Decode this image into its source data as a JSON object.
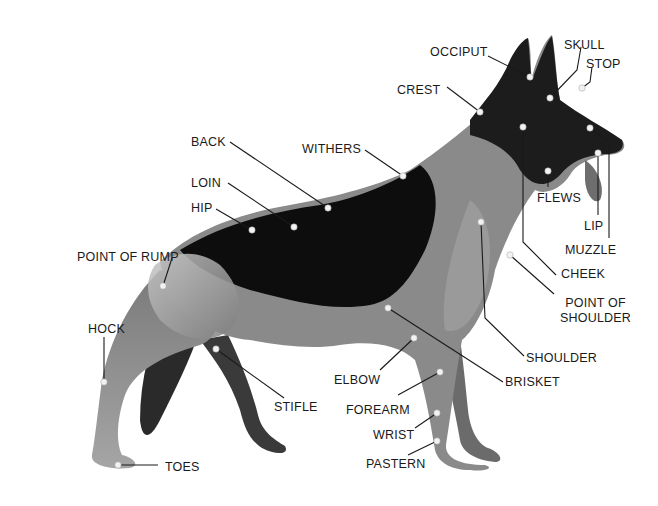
{
  "diagram": {
    "colors": {
      "background": "#ffffff",
      "saddle": "#0d0d0d",
      "tan_coat": "#8a8a8a",
      "light_coat": "#b5b5b5",
      "leader_line": "#1a1a1a",
      "point_marker": "#f2f2f2",
      "label_text": "#1a1a1a"
    },
    "labels": [
      {
        "id": "occiput",
        "text": "OCCIPUT",
        "x": 430,
        "y": 45
      },
      {
        "id": "skull",
        "text": "SKULL",
        "x": 564,
        "y": 38
      },
      {
        "id": "stop",
        "text": "STOP",
        "x": 586,
        "y": 57
      },
      {
        "id": "crest",
        "text": "CREST",
        "x": 397,
        "y": 83
      },
      {
        "id": "back",
        "text": "BACK",
        "x": 191,
        "y": 135
      },
      {
        "id": "withers",
        "text": "WITHERS",
        "x": 302,
        "y": 142
      },
      {
        "id": "loin",
        "text": "LOIN",
        "x": 191,
        "y": 176
      },
      {
        "id": "hip",
        "text": "HIP",
        "x": 191,
        "y": 201
      },
      {
        "id": "flews",
        "text": "FLEWS",
        "x": 537,
        "y": 191
      },
      {
        "id": "lip",
        "text": "LIP",
        "x": 584,
        "y": 219
      },
      {
        "id": "muzzle",
        "text": "MUZZLE",
        "x": 565,
        "y": 243
      },
      {
        "id": "point_of_rump",
        "text": "POINT OF RUMP",
        "x": 77,
        "y": 250
      },
      {
        "id": "cheek",
        "text": "CHEEK",
        "x": 561,
        "y": 267
      },
      {
        "id": "point_of_shoulder",
        "text": "POINT OF\nSHOULDER",
        "x": 560,
        "y": 296
      },
      {
        "id": "hock",
        "text": "HOCK",
        "x": 88,
        "y": 322
      },
      {
        "id": "shoulder",
        "text": "SHOULDER",
        "x": 526,
        "y": 351
      },
      {
        "id": "elbow",
        "text": "ELBOW",
        "x": 334,
        "y": 373
      },
      {
        "id": "brisket",
        "text": "BRISKET",
        "x": 505,
        "y": 375
      },
      {
        "id": "stifle",
        "text": "STIFLE",
        "x": 274,
        "y": 400
      },
      {
        "id": "forearm",
        "text": "FOREARM",
        "x": 346,
        "y": 403
      },
      {
        "id": "wrist",
        "text": "WRIST",
        "x": 373,
        "y": 428
      },
      {
        "id": "pastern",
        "text": "PASTERN",
        "x": 366,
        "y": 457
      },
      {
        "id": "toes",
        "text": "TOES",
        "x": 165,
        "y": 460
      }
    ]
  }
}
